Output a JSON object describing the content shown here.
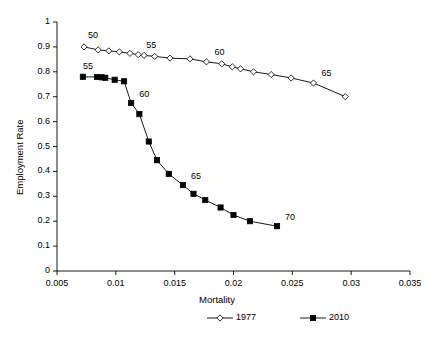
{
  "chart_data": {
    "type": "line",
    "title": "",
    "xlabel": "Mortality",
    "ylabel": "Employment Rate",
    "xlim": [
      0.005,
      0.035
    ],
    "ylim": [
      0,
      1
    ],
    "xticks": [
      "0.005",
      "0.01",
      "0.015",
      "0.02",
      "0.025",
      "0.03",
      "0.035"
    ],
    "xtick_values": [
      0.005,
      0.01,
      0.015,
      0.02,
      0.025,
      0.03,
      0.035
    ],
    "yticks": [
      "0",
      "0.1",
      "0.2",
      "0.3",
      "0.4",
      "0.5",
      "0.6",
      "0.7",
      "0.8",
      "0.9",
      "1"
    ],
    "ytick_values": [
      0,
      0.1,
      0.2,
      0.3,
      0.4,
      0.5,
      0.6,
      0.7,
      0.8,
      0.9,
      1
    ],
    "grid": false,
    "legend_position": "bottom",
    "series": [
      {
        "name": "1977",
        "marker": "open-diamond",
        "color": "#000000",
        "x": [
          0.0073,
          0.0085,
          0.0094,
          0.0103,
          0.0112,
          0.0119,
          0.0124,
          0.0133,
          0.0146,
          0.0163,
          0.0177,
          0.019,
          0.0199,
          0.0206,
          0.0217,
          0.0232,
          0.0249,
          0.0268,
          0.0295
        ],
        "y": [
          0.9,
          0.888,
          0.884,
          0.88,
          0.874,
          0.869,
          0.866,
          0.862,
          0.855,
          0.852,
          0.84,
          0.832,
          0.82,
          0.812,
          0.8,
          0.789,
          0.775,
          0.755,
          0.7
        ],
        "annotations": [
          {
            "text": "50",
            "x": 0.0073,
            "y": 0.9
          },
          {
            "text": "55",
            "x": 0.0119,
            "y": 0.869
          },
          {
            "text": "60",
            "x": 0.0177,
            "y": 0.84
          },
          {
            "text": "65",
            "x": 0.0268,
            "y": 0.755
          }
        ]
      },
      {
        "name": "2010",
        "marker": "filled-square",
        "color": "#000000",
        "x": [
          0.0072,
          0.0084,
          0.0088,
          0.0091,
          0.0099,
          0.0107,
          0.0113,
          0.012,
          0.0128,
          0.0135,
          0.0145,
          0.0157,
          0.0166,
          0.0176,
          0.0189,
          0.02,
          0.0214,
          0.0237
        ],
        "y": [
          0.78,
          0.779,
          0.778,
          0.776,
          0.768,
          0.762,
          0.675,
          0.63,
          0.52,
          0.445,
          0.39,
          0.345,
          0.31,
          0.285,
          0.255,
          0.225,
          0.2,
          0.18
        ],
        "annotations": [
          {
            "text": "55",
            "x": 0.0072,
            "y": 0.78
          },
          {
            "text": "60",
            "x": 0.0113,
            "y": 0.675
          },
          {
            "text": "65",
            "x": 0.0157,
            "y": 0.345
          },
          {
            "text": "70",
            "x": 0.0237,
            "y": 0.18
          }
        ]
      }
    ]
  },
  "legend": {
    "entries": [
      {
        "label": "1977"
      },
      {
        "label": "2010"
      }
    ]
  }
}
